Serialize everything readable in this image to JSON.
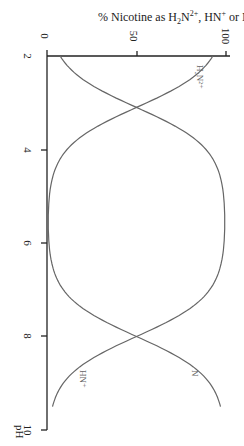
{
  "chart_data": {
    "type": "line",
    "title": "% Nicotine as H2N2+, HN+ or N",
    "xlabel": "pH",
    "ylabel": "% Nicotine as H2N2+, HN+ or N",
    "orientation": "rotated 90 degrees clockwise (pH runs top-to-bottom, percent runs left-to-right)",
    "xlim": [
      2,
      10
    ],
    "ylim": [
      0,
      100
    ],
    "x_ticks": [
      "2",
      "4",
      "6",
      "8",
      "10"
    ],
    "y_ticks": [
      "0",
      "50",
      "100"
    ],
    "grid": false,
    "pKa1": 3.1,
    "pKa2": 8.0,
    "x": [
      2.0,
      2.5,
      3.0,
      3.5,
      4.0,
      4.5,
      5.0,
      5.5,
      6.0,
      6.5,
      7.0,
      7.5,
      8.0,
      8.5,
      9.0,
      9.5
    ],
    "series": [
      {
        "name": "H2N2+",
        "label": "H₂N²⁺",
        "values": [
          92.6,
          79.9,
          55.7,
          28.5,
          11.2,
          3.8,
          1.2,
          0.4,
          0.1,
          0.0,
          0.0,
          0.0,
          0.0,
          0.0,
          0.0,
          0.0
        ]
      },
      {
        "name": "HN+",
        "label": "HN⁺",
        "values": [
          7.4,
          20.1,
          44.3,
          71.5,
          88.8,
          96.1,
          98.7,
          99.3,
          99.1,
          97.0,
          90.9,
          75.9,
          50.0,
          24.0,
          9.1,
          3.1
        ]
      },
      {
        "name": "N",
        "label": "N",
        "values": [
          0.0,
          0.0,
          0.0,
          0.0,
          0.0,
          0.0,
          0.1,
          0.3,
          0.8,
          3.1,
          9.1,
          24.0,
          50.0,
          76.0,
          90.9,
          96.9
        ]
      }
    ]
  },
  "labels": {
    "title_prefix": "% Nicotine as H",
    "title_sub1": "2",
    "title_mid1": "N",
    "title_sup1": "2+",
    "title_mid2": ", HN",
    "title_sup2": "+",
    "title_suffix": " or N",
    "y_tick_0": "0",
    "y_tick_50": "50",
    "y_tick_100": "100",
    "x_tick_2": "2",
    "x_tick_4": "4",
    "x_tick_6": "6",
    "x_tick_8": "8",
    "x_tick_10": "10",
    "x_axis_label": "pH",
    "curve_h2n2": "H₂N²⁺",
    "curve_hn": "HN⁺",
    "curve_n": "N"
  },
  "colors": {
    "axis": "#222222",
    "curve": "#666666",
    "label": "#666666"
  }
}
